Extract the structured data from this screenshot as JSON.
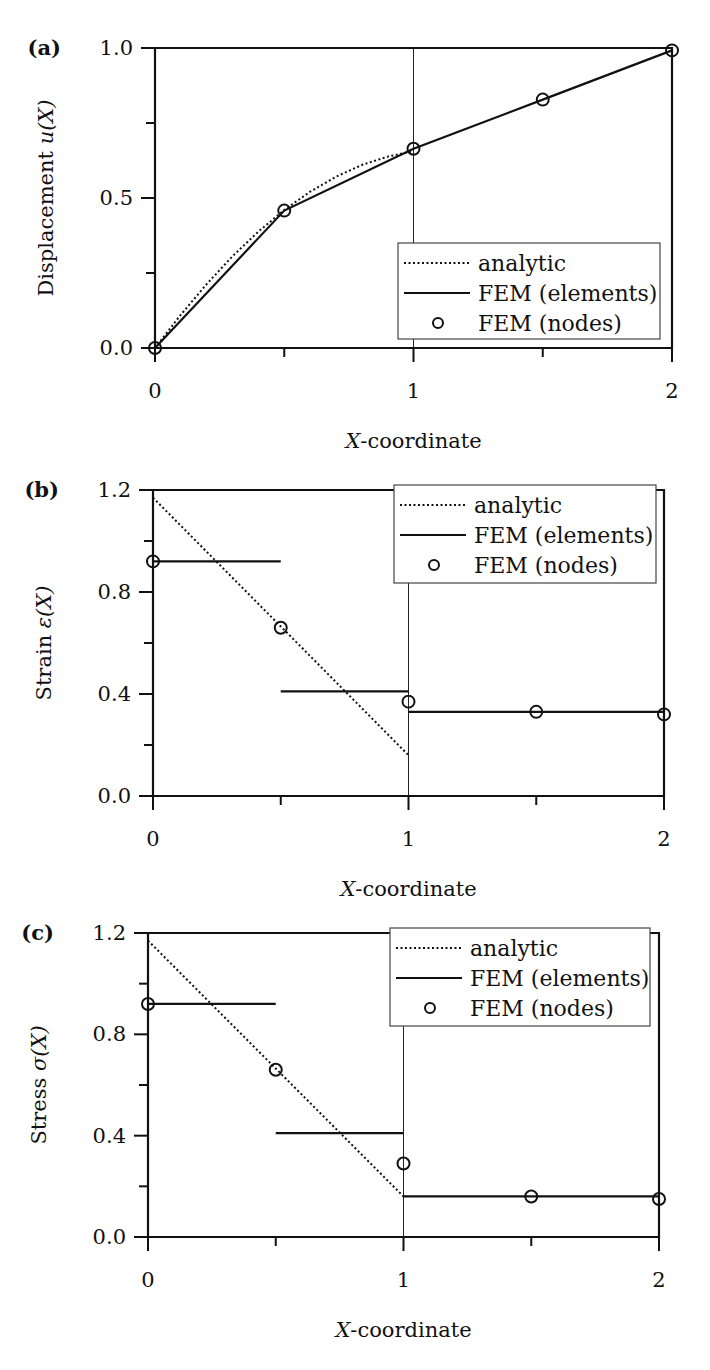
{
  "figure": {
    "x_axis_label_prefix": "X",
    "x_axis_label_suffix": "-coordinate",
    "legend": {
      "analytic": "analytic",
      "elements": "FEM (elements)",
      "nodes": "FEM (nodes)"
    }
  },
  "chart_data": [
    {
      "type": "line",
      "panel_label": "(a)",
      "title": "",
      "xlabel": "X-coordinate",
      "ylabel": "Displacement u(X)",
      "ylabel_text": "Displacement ",
      "ylabel_math": "u(X)",
      "xlim": [
        0,
        2
      ],
      "ylim": [
        0,
        1.0
      ],
      "xticks": [
        "0",
        "1",
        "2"
      ],
      "yticks": [
        "0.0",
        "0.5",
        "1.0"
      ],
      "grid": false,
      "legend_position": "lower right",
      "series": [
        {
          "name": "analytic",
          "style": "dotted",
          "x": [
            0,
            0.1,
            0.2,
            0.3,
            0.4,
            0.5,
            0.6,
            0.7,
            0.8,
            0.9,
            1.0
          ],
          "y": [
            0,
            0.111,
            0.213,
            0.306,
            0.388,
            0.46,
            0.521,
            0.571,
            0.61,
            0.638,
            0.656
          ]
        },
        {
          "name": "FEM (elements)",
          "style": "solid",
          "x": [
            0,
            0.5,
            1.0,
            1.5,
            2.0
          ],
          "y": [
            0,
            0.458,
            0.664,
            0.828,
            0.992
          ]
        },
        {
          "name": "FEM (nodes)",
          "style": "circle",
          "x": [
            0,
            0.5,
            1.0,
            1.5,
            2.0
          ],
          "y": [
            0,
            0.458,
            0.664,
            0.828,
            0.992
          ]
        }
      ],
      "vertical_line_x": 1.0
    },
    {
      "type": "line",
      "panel_label": "(b)",
      "title": "",
      "xlabel": "X-coordinate",
      "ylabel": "Strain ε(X)",
      "ylabel_text": "Strain ",
      "ylabel_math": "ε(X)",
      "xlim": [
        0,
        2
      ],
      "ylim": [
        0,
        1.2
      ],
      "xticks": [
        "0",
        "1",
        "2"
      ],
      "yticks": [
        "0.0",
        "0.4",
        "0.8",
        "1.2"
      ],
      "grid": false,
      "legend_position": "upper right",
      "series": [
        {
          "name": "analytic",
          "style": "dotted",
          "x": [
            0,
            1.0
          ],
          "y": [
            1.17,
            0.16
          ]
        },
        {
          "name": "FEM (elements)",
          "style": "solid-steps",
          "segments": [
            {
              "x": [
                0,
                0.5
              ],
              "y": 0.92
            },
            {
              "x": [
                0.5,
                1.0
              ],
              "y": 0.41
            },
            {
              "x": [
                1.0,
                2.0
              ],
              "y": 0.33
            }
          ]
        },
        {
          "name": "FEM (nodes)",
          "style": "circle",
          "x": [
            0,
            0.5,
            1.0,
            1.5,
            2.0
          ],
          "y": [
            0.92,
            0.66,
            0.37,
            0.33,
            0.32
          ]
        }
      ],
      "vertical_line_x": 1.0
    },
    {
      "type": "line",
      "panel_label": "(c)",
      "title": "",
      "xlabel": "X-coordinate",
      "ylabel": "Stress σ(X)",
      "ylabel_text": "Stress ",
      "ylabel_math": "σ(X)",
      "xlim": [
        0,
        2
      ],
      "ylim": [
        0,
        1.2
      ],
      "xticks": [
        "0",
        "1",
        "2"
      ],
      "yticks": [
        "0.0",
        "0.4",
        "0.8",
        "1.2"
      ],
      "grid": false,
      "legend_position": "upper right",
      "series": [
        {
          "name": "analytic",
          "style": "dotted",
          "x": [
            0,
            1.0
          ],
          "y": [
            1.17,
            0.16
          ]
        },
        {
          "name": "FEM (elements)",
          "style": "solid-steps",
          "segments": [
            {
              "x": [
                0,
                0.5
              ],
              "y": 0.92
            },
            {
              "x": [
                0.5,
                1.0
              ],
              "y": 0.41
            },
            {
              "x": [
                1.0,
                2.0
              ],
              "y": 0.16
            }
          ]
        },
        {
          "name": "FEM (nodes)",
          "style": "circle",
          "x": [
            0,
            0.5,
            1.0,
            1.5,
            2.0
          ],
          "y": [
            0.92,
            0.66,
            0.29,
            0.16,
            0.15
          ]
        }
      ],
      "vertical_line_x": 1.0
    }
  ]
}
